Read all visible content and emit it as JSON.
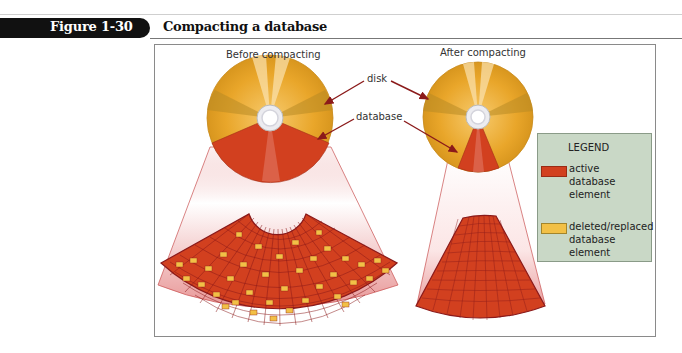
{
  "figure": {
    "number_label": "Figure 1-30",
    "title": "Compacting a database"
  },
  "diagram": {
    "before": {
      "caption": "Before compacting"
    },
    "after": {
      "caption": "After compacting"
    },
    "callouts": {
      "disk": "disk",
      "database": "database"
    }
  },
  "legend": {
    "title": "LEGEND",
    "items": [
      {
        "label": "active database element",
        "lines": [
          "active",
          "database",
          "element"
        ],
        "color": "#d2401f"
      },
      {
        "label": "deleted/replaced database element",
        "lines": [
          "deleted/replaced",
          "database",
          "element"
        ],
        "color": "#f2c046"
      }
    ]
  },
  "colors": {
    "disk_gold": "#e9a62a",
    "active_red": "#d2401f",
    "deleted_yellow": "#f2c046",
    "arrow": "#8b1a1a",
    "legend_bg": "#c9d8c6"
  }
}
